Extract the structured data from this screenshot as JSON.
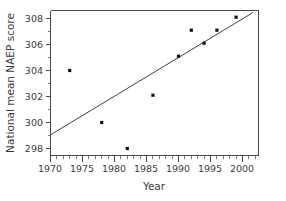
{
  "chart_data": {
    "type": "scatter",
    "title": "",
    "xlabel": "Year",
    "ylabel": "National mean NAEP score",
    "xlim": [
      1969,
      2002
    ],
    "ylim": [
      297.2,
      308.6
    ],
    "grid": false,
    "legend": null,
    "x": [
      1973,
      1978,
      1982,
      1986,
      1990,
      1992,
      1994,
      1996,
      1999
    ],
    "y": [
      304.0,
      300.0,
      298.0,
      302.1,
      305.1,
      307.1,
      306.1,
      307.1,
      308.1
    ],
    "points": [
      {
        "x": 1973,
        "y": 304.0
      },
      {
        "x": 1978,
        "y": 300.0
      },
      {
        "x": 1982,
        "y": 298.0
      },
      {
        "x": 1986,
        "y": 302.1
      },
      {
        "x": 1990,
        "y": 305.1
      },
      {
        "x": 1992,
        "y": 307.1
      },
      {
        "x": 1994,
        "y": 306.1
      },
      {
        "x": 1996,
        "y": 307.1
      },
      {
        "x": 1999,
        "y": 308.1
      }
    ],
    "xticks": [
      1970,
      1975,
      1980,
      1985,
      1990,
      1995,
      2000
    ],
    "xticklabels": [
      "1970",
      "1975",
      "1980",
      "1985",
      "1990",
      "1995",
      "2000"
    ],
    "yticks": [
      298,
      300,
      302,
      304,
      306,
      308
    ],
    "yticklabels": [
      "298",
      "300",
      "302",
      "304",
      "306",
      "308"
    ],
    "trend_line": {
      "type": "linear-fit",
      "x_start": 1970,
      "y_start": 299.05,
      "x_end": 2001.6,
      "y_end": 308.45
    },
    "marker_color": "#111111",
    "line_color": "#3f3f3f",
    "axis_color": "#4a4a4a"
  }
}
